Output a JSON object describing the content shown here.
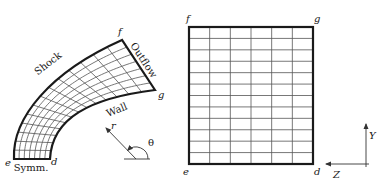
{
  "left_panel": {
    "title": "Physical domain",
    "corners": {
      "e": {
        "label": "e",
        "x": 14,
        "y": 159,
        "lx": 5,
        "ly": 166
      },
      "d": {
        "label": "d",
        "x": 50,
        "y": 159,
        "lx": 51,
        "ly": 165
      },
      "f": {
        "label": "f",
        "x": 122,
        "y": 40,
        "lx": 118,
        "ly": 35
      },
      "g": {
        "label": "g",
        "x": 155,
        "y": 90,
        "lx": 158,
        "ly": 98
      }
    },
    "boundaries": {
      "shock": {
        "label": "Shock",
        "x": 50,
        "y": 66,
        "rotate": -38
      },
      "outflow": {
        "label": "Outflow",
        "x": 141,
        "y": 62,
        "rotate": 57
      },
      "wall": {
        "label": "Wall",
        "x": 118,
        "y": 113,
        "rotate": -22
      },
      "symm": {
        "label": "Symm.",
        "x": 31,
        "y": 171,
        "rotate": 0
      }
    },
    "shock_curve": [
      [
        14,
        159
      ],
      [
        12,
        118
      ],
      [
        50,
        72
      ],
      [
        122,
        40
      ]
    ],
    "wall_curve": [
      [
        50,
        159
      ],
      [
        52,
        118
      ],
      [
        90,
        98
      ],
      [
        155,
        90
      ]
    ],
    "divisions_across": 7,
    "divisions_along": 14,
    "polar_indicator": {
      "origin": [
        136,
        159
      ],
      "baseline": [
        [
          124,
          159
        ],
        [
          150,
          159
        ]
      ],
      "arrow_tip": [
        106,
        128
      ],
      "arc_radius": 12,
      "r_label": "r",
      "r_pos": [
        111,
        129
      ],
      "theta_label": "θ",
      "theta_pos": [
        148,
        146
      ]
    }
  },
  "right_panel": {
    "title": "Computational domain",
    "rect": {
      "x": 189,
      "y": 27,
      "w": 124,
      "h": 137
    },
    "columns": 6,
    "rows": 12,
    "corners": {
      "f": {
        "label": "f",
        "x": 186,
        "y": 22
      },
      "g": {
        "label": "g",
        "x": 314,
        "y": 22
      },
      "e": {
        "label": "e",
        "x": 183,
        "y": 175
      },
      "d": {
        "label": "d",
        "x": 314,
        "y": 175
      }
    },
    "axes": {
      "origin": [
        366,
        164
      ],
      "y_tip": [
        366,
        124
      ],
      "z_tip": [
        326,
        164
      ],
      "y_label": "Y",
      "y_pos": [
        369,
        139
      ],
      "z_label": "Z",
      "z_pos": [
        333,
        178
      ]
    }
  },
  "colors": {
    "line": "#1a1a1a",
    "grid": "#555555",
    "background": "#ffffff"
  }
}
